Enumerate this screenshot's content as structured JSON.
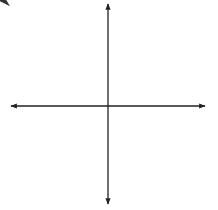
{
  "chart_data": {
    "type": "line",
    "title": "",
    "xlabel": "x",
    "ylabel": "y",
    "xlim": [
      -6,
      6
    ],
    "ylim": [
      -6,
      6
    ],
    "grid": true,
    "grid_style": "dotted",
    "tick_labels_shown": false,
    "series": [
      {
        "name": "line",
        "equation": "y = -x + 4",
        "slope": -1,
        "y_intercept": 4,
        "x_intercept": 4,
        "x": [
          -2.2,
          6
        ],
        "y": [
          6.2,
          -2
        ],
        "arrows": "both",
        "color": "#333333"
      }
    ]
  },
  "labels": {
    "x_axis": "x",
    "y_axis": "y"
  },
  "colors": {
    "grid": "#bbbbbb",
    "axis": "#222222",
    "line": "#333333"
  }
}
